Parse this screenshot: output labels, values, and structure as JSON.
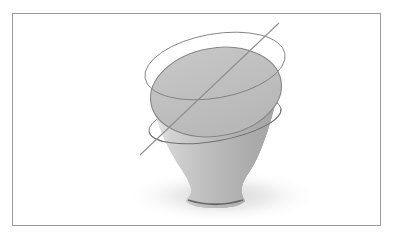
{
  "figure": {
    "canvas": {
      "width": 394,
      "height": 243,
      "background": "#ffffff"
    },
    "frame": {
      "x": 12.5,
      "y": 13.5,
      "width": 368,
      "height": 212,
      "fill": "none",
      "stroke": "#999999",
      "stroke-width": 1
    },
    "shadow": {
      "cx": 222,
      "cy": 196,
      "rx": 97,
      "ry": 27,
      "fill": "url(#gradShadow)"
    },
    "body": {
      "d": "M 152 101 C 158 128 168 150 182 170 C 189 181 192 188 191 193 C 190 197 187 198 186 201 C 191 206 201 208 215 208 C 230 208 240 206 245 201 C 244 198 242 197 242 193 C 241 187 243 181 250 171 C 261 155 272 122 280 82 A 66 44 -10 0 1 152 101 Z"
    },
    "body_fill": {
      "fill": "url(#gradBody)"
    },
    "body_bottom_shade": {
      "fill": "url(#gradBottom)"
    },
    "body_edge_highlight": {
      "fill": "url(#gradHL)"
    },
    "base_rim": {
      "d": "M 188 200 Q 215 208.5 243 200",
      "fill": "none",
      "stroke": "#5e5e5e",
      "stroke-width": 1.8,
      "opacity": 0.9
    },
    "top_face": {
      "group_transform": "translate(216,92) rotate(-10)",
      "ellipse": {
        "rx": 66,
        "ry": 44,
        "fill": "url(#gradFace)",
        "stroke": "#858585",
        "stroke-width": 1.1
      }
    },
    "upper_circle": {
      "group_transform": "translate(215,66) rotate(-10)",
      "ellipse": {
        "rx": 71,
        "ry": 32,
        "fill": "none",
        "stroke": "#7f7f7f",
        "stroke-width": 0.9
      }
    },
    "lower_circle_back": {
      "group_transform": "translate(215,120) rotate(-10)",
      "ellipse": {
        "rx": 67,
        "ry": 21,
        "fill": "none",
        "stroke": "#7f7f7f",
        "stroke-width": 0.9
      }
    },
    "lower_circle_front": {
      "group_transform": "translate(215,120) rotate(-10)",
      "path": {
        "d": "M -67 0 A 67 21 0 0 0 67 0",
        "fill": "none",
        "stroke": "#6f6f6f",
        "stroke-width": 1
      }
    },
    "diagonal_line": {
      "x1": 140,
      "y1": 155,
      "x2": 279,
      "y2": 23,
      "stroke": "#8f8f8f",
      "stroke-width": 1.1
    },
    "gradients": {
      "body": {
        "def": {
          "id": "gradBody",
          "x1": 0,
          "y1": 0,
          "x2": 1,
          "y2": 0
        },
        "s0": {
          "offset": 0,
          "stop-color": "#e9e9e9"
        },
        "s1": {
          "offset": 0.15,
          "stop-color": "#d2d2d2"
        },
        "s2": {
          "offset": 0.45,
          "stop-color": "#bcbcbc"
        },
        "s3": {
          "offset": 0.78,
          "stop-color": "#ababab"
        },
        "s4": {
          "offset": 1,
          "stop-color": "#a5a5a5"
        }
      },
      "bottom": {
        "def": {
          "id": "gradBottom",
          "x1": 0,
          "y1": 0,
          "x2": 0,
          "y2": 1
        },
        "s0": {
          "offset": 0,
          "stop-color": "#303030",
          "stop-opacity": 0
        },
        "s1": {
          "offset": 0.6,
          "stop-color": "#303030",
          "stop-opacity": 0
        },
        "s2": {
          "offset": 0.9,
          "stop-color": "#3a3a3a",
          "stop-opacity": 0.22
        },
        "s3": {
          "offset": 1,
          "stop-color": "#2e2e2e",
          "stop-opacity": 0.1
        }
      },
      "highlight": {
        "def": {
          "id": "gradHL",
          "x1": 0,
          "y1": 0,
          "x2": 1,
          "y2": 0
        },
        "s0": {
          "offset": 0,
          "stop-color": "#ffffff",
          "stop-opacity": 0.8
        },
        "s1": {
          "offset": 0.09,
          "stop-color": "#ffffff",
          "stop-opacity": 0.3
        },
        "s2": {
          "offset": 0.18,
          "stop-color": "#ffffff",
          "stop-opacity": 0
        },
        "s3": {
          "offset": 0.93,
          "stop-color": "#ffffff",
          "stop-opacity": 0
        },
        "s4": {
          "offset": 1,
          "stop-color": "#ffffff",
          "stop-opacity": 0.45
        }
      },
      "face": {
        "def": {
          "id": "gradFace",
          "x1": 0,
          "y1": 0,
          "x2": 0.3,
          "y2": 1
        },
        "s0": {
          "offset": 0,
          "stop-color": "#c7c7c7"
        },
        "s1": {
          "offset": 1,
          "stop-color": "#b8b8b8"
        }
      },
      "shadow": {
        "def": {
          "id": "gradShadow",
          "cx": 0.5,
          "cy": 0.5,
          "r": 0.5
        },
        "s0": {
          "offset": 0,
          "stop-color": "#8f8f8f",
          "stop-opacity": 0.38
        },
        "s1": {
          "offset": 0.45,
          "stop-color": "#9f9f9f",
          "stop-opacity": 0.22
        },
        "s2": {
          "offset": 1,
          "stop-color": "#ffffff",
          "stop-opacity": 0
        }
      }
    }
  }
}
